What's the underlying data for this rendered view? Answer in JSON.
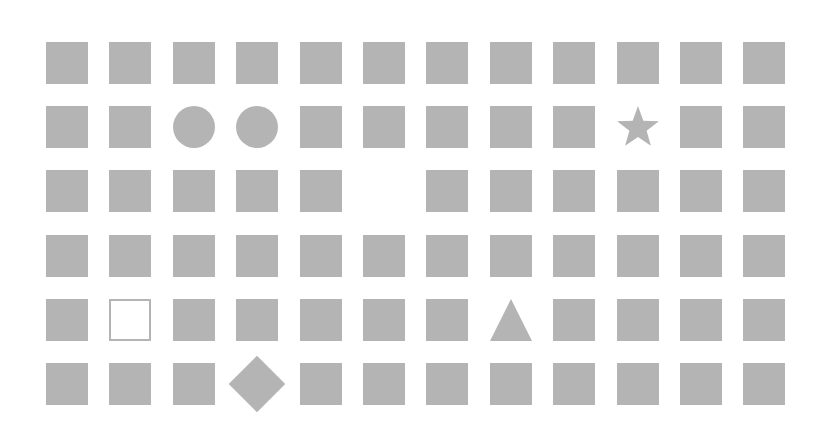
{
  "grid": {
    "columns": 12,
    "rows": 6,
    "origin_x": 46,
    "origin_y": 42,
    "pitch_x": 63.4,
    "pitch_y": 64.2,
    "cell_size": 42,
    "fill_color": "#b4b4b4",
    "background_color": "#ffffff",
    "cells": [
      [
        "square",
        "square",
        "square",
        "square",
        "square",
        "square",
        "square",
        "square",
        "square",
        "square",
        "square",
        "square"
      ],
      [
        "square",
        "square",
        "circle",
        "circle",
        "square",
        "square",
        "square",
        "square",
        "square",
        "star",
        "square",
        "square"
      ],
      [
        "square",
        "square",
        "square",
        "square",
        "square",
        "empty",
        "square",
        "square",
        "square",
        "square",
        "square",
        "square"
      ],
      [
        "square",
        "square",
        "square",
        "square",
        "square",
        "square",
        "square",
        "square",
        "square",
        "square",
        "square",
        "square"
      ],
      [
        "square",
        "outline-square",
        "square",
        "square",
        "square",
        "square",
        "square",
        "triangle",
        "square",
        "square",
        "square",
        "square"
      ],
      [
        "square",
        "square",
        "square",
        "diamond",
        "square",
        "square",
        "square",
        "square",
        "square",
        "square",
        "square",
        "square"
      ]
    ]
  }
}
